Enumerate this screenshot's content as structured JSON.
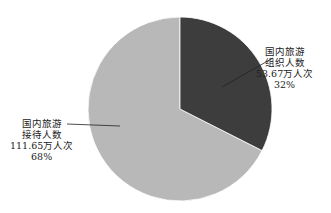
{
  "chart_data": {
    "type": "pie",
    "title": "",
    "categories": [
      "国内旅游组织人数",
      "国内旅游接待人数"
    ],
    "values": [
      53.67,
      111.65
    ],
    "unit": "万人次",
    "percentages": [
      "32%",
      "68%"
    ],
    "colors": [
      "#3d3d3d",
      "#b8b8b8"
    ],
    "start_angle": "12 o'clock, clockwise",
    "legend": "none (callout labels)"
  },
  "labels": {
    "organized": {
      "line1": "国内旅游",
      "line2": "组织人数",
      "line3": "53.67万人次",
      "line4": "32%"
    },
    "received": {
      "line1": "国内旅游",
      "line2": "接待人数",
      "line3": "111.65万人次",
      "line4": "68%"
    }
  }
}
